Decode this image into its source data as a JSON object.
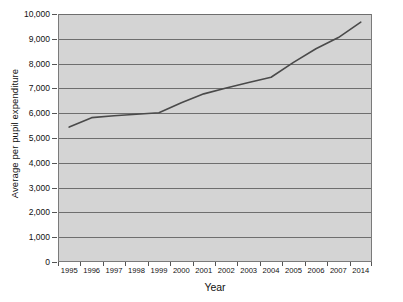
{
  "chart_data": {
    "type": "line",
    "title": "",
    "xlabel": "Year",
    "ylabel": "Average per pupil expenditure",
    "grid": true,
    "legend": false,
    "ylim": [
      0,
      10000
    ],
    "yticks": [
      0,
      1000,
      2000,
      3000,
      4000,
      5000,
      6000,
      7000,
      8000,
      9000,
      10000
    ],
    "ytick_labels": [
      "0",
      "1,000",
      "2,000",
      "3,000",
      "4,000",
      "5,000",
      "6,000",
      "7,000",
      "8,000",
      "9,000",
      "10,000"
    ],
    "categories": [
      "1995",
      "1996",
      "1997",
      "1998",
      "1999",
      "2000",
      "2001",
      "2002",
      "2003",
      "2004",
      "2005",
      "2006",
      "2007",
      "2014"
    ],
    "values": [
      5440,
      5820,
      5900,
      5960,
      6020,
      6420,
      6780,
      7020,
      7240,
      7450,
      8050,
      8600,
      9050,
      9670
    ],
    "series": [
      {
        "name": "Average per pupil expenditure",
        "color": "#4a4a4a",
        "values": [
          5440,
          5820,
          5900,
          5960,
          6020,
          6420,
          6780,
          7020,
          7240,
          7450,
          8050,
          8600,
          9050,
          9670
        ]
      }
    ],
    "plot_background": "#d4d4d4",
    "gridline_color": "#6e6e6e",
    "axis_color": "#7a7a7a"
  }
}
